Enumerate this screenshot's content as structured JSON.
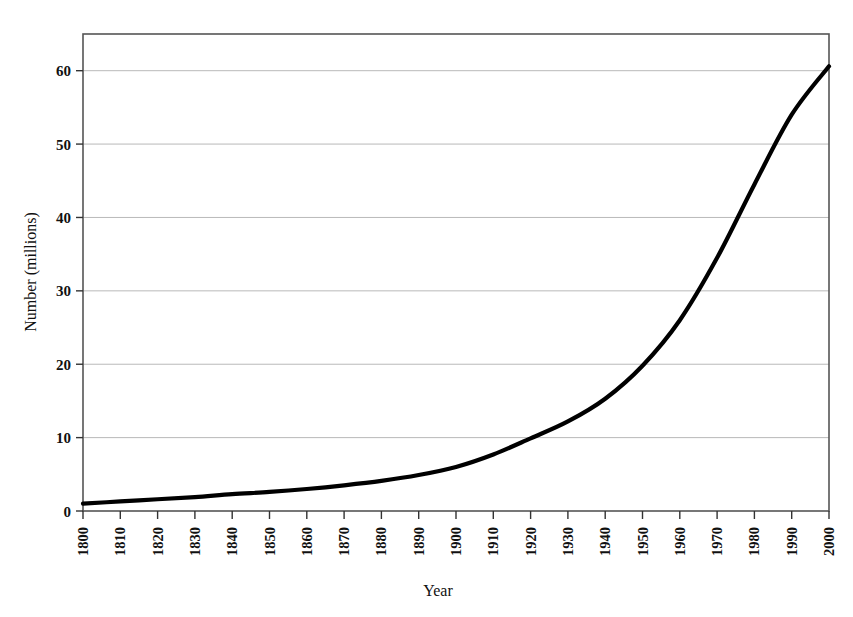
{
  "chart_data": {
    "type": "line",
    "title": "",
    "xlabel": "Year",
    "ylabel": "Number (millions)",
    "xlim": [
      1800,
      2000
    ],
    "ylim": [
      0,
      65
    ],
    "yticks": [
      0,
      10,
      20,
      30,
      40,
      50,
      60
    ],
    "ytick_labels": [
      "0",
      "10",
      "20",
      "30",
      "40",
      "50",
      "60"
    ],
    "xticks": [
      1800,
      1810,
      1820,
      1830,
      1840,
      1850,
      1860,
      1870,
      1880,
      1890,
      1900,
      1910,
      1920,
      1930,
      1940,
      1950,
      1960,
      1970,
      1980,
      1990,
      2000
    ],
    "xtick_labels": [
      "1800",
      "1810",
      "1820",
      "1830",
      "1840",
      "1850",
      "1860",
      "1870",
      "1880",
      "1890",
      "1900",
      "1910",
      "1920",
      "1930",
      "1940",
      "1950",
      "1960",
      "1970",
      "1980",
      "1990",
      "2000"
    ],
    "grid": "horizontal",
    "legend": "none",
    "series": [
      {
        "name": "Number (millions)",
        "color": "#000000",
        "x": [
          1800,
          1810,
          1820,
          1830,
          1840,
          1850,
          1860,
          1870,
          1880,
          1890,
          1900,
          1910,
          1920,
          1930,
          1940,
          1950,
          1960,
          1970,
          1980,
          1990,
          2000
        ],
        "values": [
          1.0,
          1.3,
          1.6,
          1.9,
          2.3,
          2.6,
          3.0,
          3.5,
          4.1,
          4.9,
          6.0,
          7.7,
          9.9,
          12.2,
          15.3,
          19.8,
          26.0,
          34.5,
          44.5,
          54.0,
          60.6
        ]
      }
    ]
  },
  "axes": {
    "y_axis_title": "Number (millions)",
    "x_axis_title": "Year"
  },
  "figure": {
    "background_color": "#ffffff",
    "line_color": "#000000",
    "grid_color": "#b9b9b9",
    "frame_color": "#555555"
  }
}
